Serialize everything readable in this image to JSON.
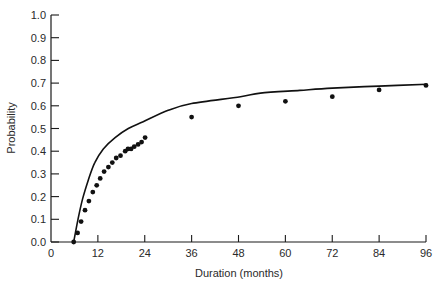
{
  "chart_data": {
    "type": "scatter",
    "title": "",
    "xlabel": "Duration (months)",
    "ylabel": "Probability",
    "xlim": [
      0,
      96
    ],
    "ylim": [
      0,
      1.0
    ],
    "grid": false,
    "legend": null,
    "x_ticks": [
      0,
      12,
      24,
      36,
      48,
      60,
      72,
      84,
      96
    ],
    "x_tick_labels": [
      "0",
      "12",
      "24",
      "36",
      "48",
      "60",
      "72",
      "84",
      "96"
    ],
    "y_ticks": [
      0.0,
      0.1,
      0.2,
      0.3,
      0.4,
      0.5,
      0.6,
      0.7,
      0.8,
      0.9,
      1.0
    ],
    "y_tick_labels": [
      "0.0",
      "0.1",
      "0.2",
      "0.3",
      "0.4",
      "0.5",
      "0.6",
      "0.7",
      "0.8",
      "0.9",
      "1.0"
    ],
    "series": [
      {
        "name": "Observed",
        "type": "scatter",
        "x": [
          5.8,
          6.8,
          7.7,
          8.7,
          9.7,
          10.7,
          11.7,
          12.6,
          13.6,
          14.7,
          15.7,
          16.7,
          17.8,
          19.0,
          19.7,
          20.5,
          21.3,
          22.3,
          23.2,
          24.1,
          36,
          48,
          60,
          72,
          84,
          96
        ],
        "y": [
          0.0,
          0.04,
          0.09,
          0.14,
          0.18,
          0.22,
          0.25,
          0.28,
          0.31,
          0.33,
          0.35,
          0.37,
          0.38,
          0.4,
          0.41,
          0.41,
          0.42,
          0.43,
          0.44,
          0.46,
          0.55,
          0.6,
          0.62,
          0.64,
          0.67,
          0.69
        ]
      },
      {
        "name": "Fitted curve",
        "type": "line",
        "x": [
          5.8,
          6.9,
          8.1,
          9.5,
          11.2,
          13.4,
          16.4,
          19.8,
          23.6,
          30,
          36,
          48.5,
          53.6,
          63.7,
          72,
          84,
          96.3
        ],
        "y": [
          0.0,
          0.1,
          0.19,
          0.27,
          0.35,
          0.41,
          0.46,
          0.5,
          0.53,
          0.58,
          0.61,
          0.64,
          0.656,
          0.668,
          0.678,
          0.687,
          0.695
        ]
      }
    ]
  }
}
